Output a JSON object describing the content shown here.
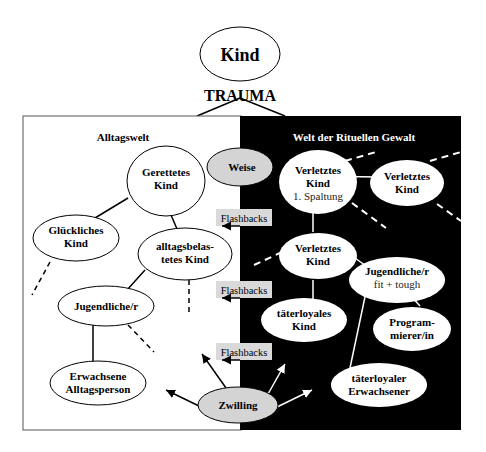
{
  "root": {
    "label": "Kind",
    "trauma_label": "TRAUMA"
  },
  "panels": {
    "left_title": "Alltagswelt",
    "right_title": "Welt der Rituellen Gewalt"
  },
  "colors": {
    "left_bg": "#ffffff",
    "right_bg": "#000000",
    "grey_node": "#d4d4d4",
    "flashback_box": "#d9d9d9",
    "line": "#000000",
    "line_inverse": "#ffffff"
  },
  "nodes": {
    "gerettetes": {
      "line1": "Gerettetes",
      "line2": "Kind"
    },
    "glueckliches": {
      "line1": "Glückliches",
      "line2": "Kind"
    },
    "alltagsbelastet": {
      "line1": "alltagsbelas-",
      "line2": "tetes Kind"
    },
    "jugendliche_left": {
      "line1": "Jugendliche/r"
    },
    "erwachsene": {
      "line1": "Erwachsene",
      "line2": "Alltagsperson"
    },
    "weise": {
      "line1": "Weise"
    },
    "zwilling": {
      "line1": "Zwilling"
    },
    "verletztes1": {
      "line1": "Verletztes",
      "line2": "Kind",
      "line3": "1. Spaltung"
    },
    "verletztes2": {
      "line1": "Verletztes",
      "line2": "Kind"
    },
    "verletztes3": {
      "line1": "Verletztes",
      "line2": "Kind"
    },
    "jugendliche_right": {
      "line1": "Jugendliche/r",
      "line2": "fit + tough"
    },
    "taeterloyales_kind": {
      "line1": "täterloyales",
      "line2": "Kind"
    },
    "programmierer": {
      "line1": "Program-",
      "line2": "mierer/in"
    },
    "taeterloyaler_erw": {
      "line1": "täterloyaler",
      "line2": "Erwachsener"
    }
  },
  "flashbacks": [
    {
      "label": "Flashbacks"
    },
    {
      "label": "Flashbacks"
    },
    {
      "label": "Flashbacks"
    }
  ]
}
